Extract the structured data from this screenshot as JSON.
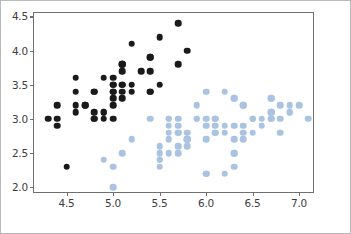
{
  "chart": {
    "title": "",
    "xlabel": "",
    "ylabel": "",
    "background_color": "#ffffff",
    "axes_edge_color": "#6f6f6f",
    "figure_border_color": "#b9b9b9"
  },
  "chart_data": {
    "type": "scatter",
    "title": "",
    "xlabel": "",
    "ylabel": "",
    "xlim": [
      4.15,
      7.15
    ],
    "ylim": [
      1.93,
      4.55
    ],
    "xticks": [
      4.5,
      5.0,
      5.5,
      6.0,
      6.5,
      7.0
    ],
    "xtick_labels": [
      "4.5",
      "5.0",
      "5.5",
      "6.0",
      "6.5",
      "7.0"
    ],
    "yticks": [
      2.0,
      2.5,
      3.0,
      3.5,
      4.0,
      4.5
    ],
    "ytick_labels": [
      "2.0",
      "2.5",
      "3.0",
      "3.5",
      "4.0",
      "4.5"
    ],
    "grid": false,
    "legend": null,
    "marker": "circle",
    "marker_size": 6.6,
    "series": [
      {
        "name": "setosa",
        "color": "#1a1a1a",
        "points": [
          [
            5.1,
            3.5
          ],
          [
            4.9,
            3.0
          ],
          [
            4.7,
            3.2
          ],
          [
            4.6,
            3.1
          ],
          [
            5.0,
            3.6
          ],
          [
            5.4,
            3.9
          ],
          [
            4.6,
            3.4
          ],
          [
            5.0,
            3.4
          ],
          [
            4.4,
            2.9
          ],
          [
            4.9,
            3.1
          ],
          [
            5.4,
            3.7
          ],
          [
            4.8,
            3.4
          ],
          [
            4.8,
            3.0
          ],
          [
            4.3,
            3.0
          ],
          [
            5.8,
            4.0
          ],
          [
            5.7,
            4.4
          ],
          [
            5.4,
            3.9
          ],
          [
            5.1,
            3.5
          ],
          [
            5.7,
            3.8
          ],
          [
            5.1,
            3.8
          ],
          [
            5.4,
            3.4
          ],
          [
            5.1,
            3.7
          ],
          [
            4.6,
            3.6
          ],
          [
            5.1,
            3.3
          ],
          [
            4.8,
            3.4
          ],
          [
            5.0,
            3.0
          ],
          [
            5.0,
            3.4
          ],
          [
            5.2,
            3.5
          ],
          [
            5.2,
            3.4
          ],
          [
            4.7,
            3.2
          ],
          [
            4.8,
            3.1
          ],
          [
            5.4,
            3.4
          ],
          [
            5.2,
            4.1
          ],
          [
            5.5,
            4.2
          ],
          [
            4.9,
            3.1
          ],
          [
            5.0,
            3.2
          ],
          [
            5.5,
            3.5
          ],
          [
            4.9,
            3.6
          ],
          [
            4.4,
            3.0
          ],
          [
            5.1,
            3.4
          ],
          [
            5.0,
            3.5
          ],
          [
            4.5,
            2.3
          ],
          [
            4.4,
            3.2
          ],
          [
            5.0,
            3.5
          ],
          [
            5.1,
            3.8
          ],
          [
            4.8,
            3.0
          ],
          [
            5.1,
            3.8
          ],
          [
            4.6,
            3.2
          ],
          [
            5.3,
            3.7
          ],
          [
            5.0,
            3.3
          ]
        ]
      },
      {
        "name": "versicolor-virginica",
        "color": "#a9c3e0",
        "points": [
          [
            7.0,
            3.2
          ],
          [
            6.4,
            3.2
          ],
          [
            6.9,
            3.1
          ],
          [
            5.5,
            2.3
          ],
          [
            6.5,
            2.8
          ],
          [
            5.7,
            2.8
          ],
          [
            6.3,
            3.3
          ],
          [
            4.9,
            2.4
          ],
          [
            6.6,
            2.9
          ],
          [
            5.2,
            2.7
          ],
          [
            5.0,
            2.0
          ],
          [
            5.9,
            3.0
          ],
          [
            6.0,
            2.2
          ],
          [
            6.1,
            2.9
          ],
          [
            5.6,
            2.9
          ],
          [
            6.7,
            3.1
          ],
          [
            5.6,
            3.0
          ],
          [
            5.8,
            2.7
          ],
          [
            6.2,
            2.2
          ],
          [
            5.6,
            2.5
          ],
          [
            5.9,
            3.2
          ],
          [
            6.1,
            2.8
          ],
          [
            6.3,
            2.5
          ],
          [
            6.1,
            2.8
          ],
          [
            6.4,
            2.9
          ],
          [
            6.6,
            3.0
          ],
          [
            6.8,
            2.8
          ],
          [
            6.7,
            3.0
          ],
          [
            6.0,
            2.9
          ],
          [
            5.7,
            2.6
          ],
          [
            5.5,
            2.4
          ],
          [
            5.5,
            2.4
          ],
          [
            5.8,
            2.7
          ],
          [
            6.0,
            2.7
          ],
          [
            5.4,
            3.0
          ],
          [
            6.0,
            3.4
          ],
          [
            6.7,
            3.1
          ],
          [
            6.3,
            2.3
          ],
          [
            5.6,
            3.0
          ],
          [
            5.5,
            2.5
          ],
          [
            5.5,
            2.6
          ],
          [
            6.1,
            3.0
          ],
          [
            5.8,
            2.6
          ],
          [
            5.0,
            2.3
          ],
          [
            5.6,
            2.7
          ],
          [
            5.7,
            3.0
          ],
          [
            5.7,
            2.9
          ],
          [
            6.2,
            2.9
          ],
          [
            5.1,
            2.5
          ],
          [
            5.7,
            2.8
          ],
          [
            6.3,
            3.3
          ],
          [
            5.8,
            2.7
          ],
          [
            7.1,
            3.0
          ],
          [
            6.3,
            2.9
          ],
          [
            6.5,
            3.0
          ],
          [
            6.4,
            2.7
          ],
          [
            6.8,
            3.0
          ],
          [
            5.7,
            2.5
          ],
          [
            5.8,
            2.8
          ],
          [
            6.4,
            3.2
          ],
          [
            6.5,
            3.0
          ],
          [
            6.0,
            2.2
          ],
          [
            6.9,
            3.2
          ],
          [
            5.6,
            2.8
          ],
          [
            6.3,
            2.7
          ],
          [
            6.7,
            3.3
          ],
          [
            6.2,
            2.8
          ],
          [
            6.1,
            3.0
          ],
          [
            6.4,
            2.8
          ],
          [
            6.0,
            3.0
          ],
          [
            6.9,
            3.1
          ],
          [
            6.7,
            3.1
          ],
          [
            5.8,
            2.7
          ],
          [
            6.8,
            3.2
          ],
          [
            6.7,
            3.3
          ],
          [
            6.7,
            3.0
          ],
          [
            6.3,
            2.5
          ],
          [
            6.5,
            3.0
          ],
          [
            6.2,
            3.4
          ],
          [
            5.9,
            3.0
          ]
        ]
      }
    ]
  }
}
